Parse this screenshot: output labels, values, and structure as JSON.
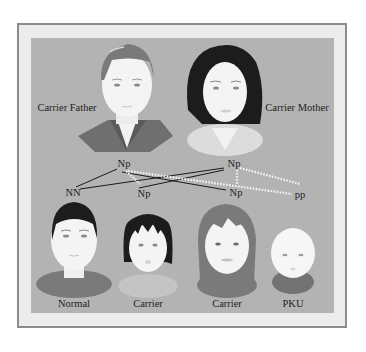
{
  "diagram": {
    "colors": {
      "frame_border": "#8c8c8c",
      "frame_fill": "#ececec",
      "panel": "#b3b3b3",
      "skin": "#f4f4f4",
      "dark_hair": "#1e1e1e",
      "mid_hair": "#737373",
      "line_solid": "#1a1a1a",
      "line_dotted": "#f5f5f5"
    },
    "parents": [
      {
        "id": "father",
        "label": "Carrier Father",
        "genotype": "Np"
      },
      {
        "id": "mother",
        "label": "Carrier Mother",
        "genotype": "Np"
      }
    ],
    "children": [
      {
        "id": "child1",
        "label": "Normal",
        "genotype": "NN"
      },
      {
        "id": "child2",
        "label": "Carrier",
        "genotype": "Np"
      },
      {
        "id": "child3",
        "label": "Carrier",
        "genotype": "Np"
      },
      {
        "id": "child4",
        "label": "PKU",
        "genotype": "pp"
      }
    ],
    "edges": [
      {
        "from": "father",
        "to": "child1",
        "style": "solid"
      },
      {
        "from": "mother",
        "to": "child1",
        "style": "solid"
      },
      {
        "from": "father",
        "to": "child3",
        "style": "solid"
      },
      {
        "from": "mother",
        "to": "child2",
        "style": "solid"
      },
      {
        "from": "father",
        "to": "child2",
        "style": "dotted"
      },
      {
        "from": "father",
        "to": "child4",
        "style": "dotted"
      },
      {
        "from": "mother",
        "to": "child3",
        "style": "dotted"
      },
      {
        "from": "mother",
        "to": "child4",
        "style": "dotted"
      }
    ]
  }
}
